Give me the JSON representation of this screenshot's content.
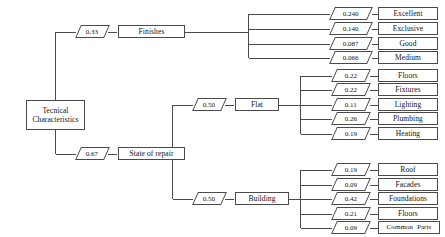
{
  "diagram": {
    "type": "weighted-hierarchy-tree",
    "title_node": "Tecnical Characteristics",
    "root": {
      "name": "root-node",
      "line1": "Tecnical",
      "line2": "Characteristics"
    },
    "level1": [
      {
        "id": "finishes",
        "label": "Finishes",
        "weight": "0.33"
      },
      {
        "id": "state-of-repair",
        "label": "State of repair",
        "weight": "0.67"
      }
    ],
    "level2": [
      {
        "id": "flat",
        "label": "Flat",
        "weight": "0.50",
        "parent": "state-of-repair"
      },
      {
        "id": "building",
        "label": "Building",
        "weight": "0.50",
        "parent": "state-of-repair"
      }
    ],
    "finishes_children": [
      {
        "label": "Excellent",
        "weight": "0.240"
      },
      {
        "label": "Exclusive",
        "weight": "0.140"
      },
      {
        "label": "Good",
        "weight": "0.087"
      },
      {
        "label": "Medium",
        "weight": "0.066"
      }
    ],
    "flat_children": [
      {
        "label": "Floors",
        "weight": "0.22"
      },
      {
        "label": "Fixtures",
        "weight": "0.22"
      },
      {
        "label": "Lighting",
        "weight": "0.11"
      },
      {
        "label": "Plumbing",
        "weight": "0.26"
      },
      {
        "label": "Heating",
        "weight": "0.19"
      }
    ],
    "building_children": [
      {
        "label": "Roof",
        "weight": "0.19"
      },
      {
        "label": "Facades",
        "weight": "0.09"
      },
      {
        "label": "Foundations",
        "weight": "0.42"
      },
      {
        "label": "Floors",
        "weight": "0.21"
      },
      {
        "label": "Common  Parts",
        "weight": "0.09"
      }
    ],
    "colors": {
      "line": "#4a4a4a",
      "text": "#111111",
      "background": "#ffffff"
    }
  }
}
